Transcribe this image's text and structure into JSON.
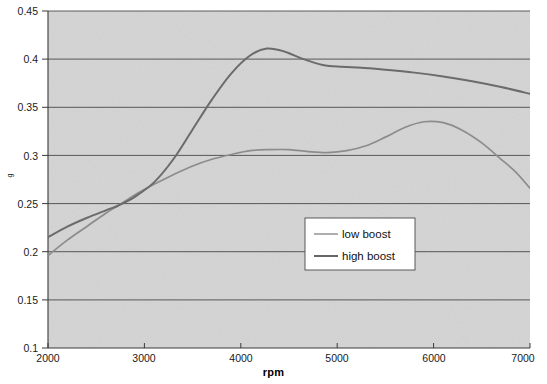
{
  "chart_data": {
    "type": "line",
    "title": "",
    "xlabel": "rpm",
    "ylabel": "g",
    "xlim": [
      2000,
      7000
    ],
    "ylim": [
      0.1,
      0.45
    ],
    "xticks": [
      "2000",
      "3000",
      "4000",
      "5000",
      "6000",
      "7000"
    ],
    "yticks": [
      "0.1",
      "0.15",
      "0.2",
      "0.25",
      "0.3",
      "0.35",
      "0.4",
      "0.45"
    ],
    "grid": "horizontal",
    "legend_position": "center-right-inside",
    "plot_background": "#d4d4d4",
    "series": [
      {
        "name": "low boost",
        "color": "#8c8c8c",
        "x": [
          2000,
          2200,
          2400,
          2600,
          2730,
          2900,
          3100,
          3300,
          3500,
          3700,
          3900,
          4100,
          4300,
          4500,
          4700,
          4900,
          5100,
          5300,
          5500,
          5700,
          5900,
          6100,
          6300,
          6500,
          6700,
          6850,
          7000
        ],
        "y": [
          0.196,
          0.212,
          0.226,
          0.24,
          0.248,
          0.259,
          0.27,
          0.28,
          0.289,
          0.296,
          0.301,
          0.305,
          0.306,
          0.306,
          0.304,
          0.303,
          0.305,
          0.31,
          0.319,
          0.329,
          0.335,
          0.334,
          0.326,
          0.313,
          0.296,
          0.283,
          0.266
        ]
      },
      {
        "name": "high boost",
        "color": "#6b6b6b",
        "x": [
          2000,
          2200,
          2400,
          2600,
          2730,
          2900,
          3100,
          3300,
          3500,
          3700,
          3900,
          4100,
          4270,
          4450,
          4650,
          4850,
          5050,
          5250,
          5500,
          5800,
          6100,
          6400,
          6700,
          7000
        ],
        "y": [
          0.215,
          0.226,
          0.235,
          0.243,
          0.248,
          0.257,
          0.272,
          0.296,
          0.327,
          0.358,
          0.385,
          0.404,
          0.411,
          0.408,
          0.4,
          0.394,
          0.392,
          0.391,
          0.389,
          0.386,
          0.382,
          0.377,
          0.371,
          0.364
        ]
      }
    ]
  },
  "legend": {
    "items": [
      {
        "label": "low boost",
        "color": "#9a9a9a"
      },
      {
        "label": "high boost",
        "color": "#5e5e5e"
      }
    ]
  }
}
